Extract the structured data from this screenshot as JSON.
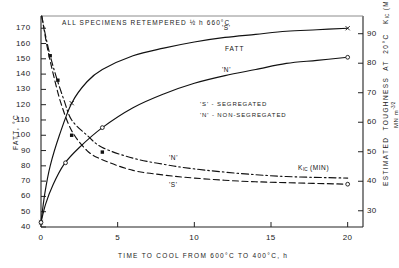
{
  "figure": {
    "annotation_title": "ALL SPECIMENS RETEMPERED ½ h 660°C",
    "legend_s": "'S' - SEGREGATED",
    "legend_n": "'N' - NON-SEGREGATED",
    "fatt_group_label": "FATT",
    "label_s_upper": "'S'",
    "label_n_upper": "'N'",
    "label_n_lower": "'N'",
    "label_s_lower": "'S'",
    "kic_label_main": "K",
    "kic_label_sub": "IC",
    "kic_label_tail": " (MIN)"
  },
  "chart_data": {
    "type": "line",
    "title": "ALL SPECIMENS RETEMPERED ½ h 660°C",
    "xlabel": "TIME TO COOL FROM 600°C TO 400°C, h",
    "ylabel": "FATT, °C",
    "y2label": "ESTIMATED TOUGHNESS AT 20°C K_IC (MINIMUM)  MN m^-3/2",
    "xlim": [
      0,
      21
    ],
    "ylim": [
      40,
      178
    ],
    "y2lim": [
      24.5,
      96
    ],
    "grid": false,
    "legend_position": "inside-center-right",
    "xticks": [
      0,
      5,
      10,
      15,
      20
    ],
    "xtick_labels": [
      "0",
      "5",
      "10",
      "15",
      "20"
    ],
    "yticks": [
      40,
      50,
      60,
      70,
      80,
      90,
      100,
      110,
      120,
      130,
      140,
      150,
      160,
      170
    ],
    "ytick_labels": [
      "40",
      "50",
      "60",
      "70",
      "80",
      "90",
      "100",
      "110",
      "120",
      "130",
      "140",
      "150",
      "160",
      "170"
    ],
    "y2ticks": [
      30,
      40,
      50,
      60,
      70,
      80,
      90
    ],
    "y2tick_labels": [
      "30",
      "40",
      "50",
      "60",
      "70",
      "80",
      "90"
    ],
    "series": [
      {
        "name": "'S' FATT",
        "style": "solid",
        "marker": "cross",
        "axis": "left",
        "x": [
          0,
          0.25,
          0.6,
          1.2,
          2,
          3,
          4,
          6,
          8,
          10,
          12,
          14,
          16,
          18,
          20
        ],
        "y": [
          43,
          62,
          80,
          100,
          121,
          135,
          143,
          152,
          157,
          161,
          164,
          166,
          168,
          169,
          170
        ],
        "marker_points": [
          [
            0,
            43
          ],
          [
            2,
            121
          ],
          [
            20,
            170
          ]
        ]
      },
      {
        "name": "'N' FATT",
        "style": "solid",
        "marker": "open-circle",
        "axis": "left",
        "x": [
          0,
          0.3,
          0.8,
          1.5,
          2.5,
          4,
          6,
          8,
          10,
          12,
          14,
          16,
          18,
          20
        ],
        "y": [
          43,
          55,
          68,
          81,
          92,
          105,
          118,
          127,
          134,
          139,
          143,
          147,
          149,
          151
        ],
        "marker_points": [
          [
            0,
            43
          ],
          [
            1.6,
            82
          ],
          [
            4,
            105
          ],
          [
            20,
            151
          ]
        ]
      },
      {
        "name": "'N' K_IC minimum",
        "style": "dash-dot",
        "marker": "filled-square",
        "axis": "left",
        "x": [
          0.05,
          0.3,
          0.6,
          1,
          1.5,
          2,
          3,
          4,
          6,
          8,
          10,
          13,
          16,
          20
        ],
        "y": [
          178,
          165,
          152,
          138,
          123,
          110,
          100,
          92,
          85,
          81,
          78,
          75,
          73,
          72
        ],
        "marker_points": [
          [
            0.6,
            152
          ],
          [
            1.1,
            136
          ],
          [
            2,
            100
          ],
          [
            4,
            89
          ]
        ]
      },
      {
        "name": "'S' K_IC minimum",
        "style": "dashed",
        "marker": "open-circle",
        "axis": "left",
        "x": [
          0.05,
          0.4,
          0.8,
          1.3,
          2,
          3,
          4,
          6,
          8,
          10,
          13,
          16,
          20
        ],
        "y": [
          178,
          158,
          140,
          121,
          103,
          90,
          84,
          77,
          74,
          72,
          70,
          69,
          68
        ],
        "marker_points": [
          [
            20,
            68
          ]
        ]
      }
    ],
    "annotations": [
      {
        "text": "'S' - SEGREGATED",
        "x": 10.4,
        "y": 108
      },
      {
        "text": "'N' - NON-SEGREGATED",
        "x": 10.4,
        "y": 101
      },
      {
        "text": "FATT",
        "x": 11.6,
        "y": 161
      },
      {
        "text": "'S'",
        "x": 11.3,
        "y": 169
      },
      {
        "text": "'N'",
        "x": 11.3,
        "y": 150
      },
      {
        "text": "'N'",
        "x": 9.0,
        "y": 78
      },
      {
        "text": "'S'",
        "x": 9.0,
        "y": 66
      },
      {
        "text": "K IC (MIN)",
        "x": 17.0,
        "y": 78
      }
    ]
  }
}
